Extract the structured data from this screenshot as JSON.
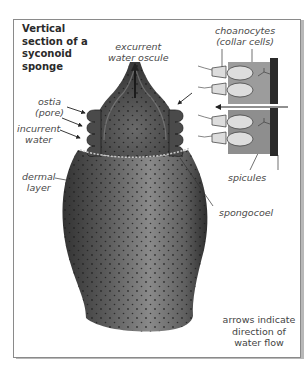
{
  "title": {
    "line1": "Vertical",
    "line2": "section of a",
    "line3": "syconoid",
    "line4": "sponge"
  },
  "labels": {
    "excurrent": {
      "line1": "excurrent",
      "line2": "water oscule"
    },
    "choanocytes": {
      "line1": "choanocytes",
      "line2": "(collar cells)"
    },
    "ostia": {
      "line1": "ostia",
      "line2": "(pore)"
    },
    "incurrent": {
      "line1": "incurrent",
      "line2": "water"
    },
    "dermal": {
      "line1": "dermal",
      "line2": "layer"
    },
    "spicules": "spicules",
    "spongocoel": "spongocoel"
  },
  "note": "arrows indicate direction of water flow",
  "colors": {
    "body_dark": "#3a3a3a",
    "body_mid": "#6e6e6e",
    "body_light": "#9a9a9a",
    "cell_fill": "#9c9c9c",
    "label_text": "#4a4a4a"
  }
}
